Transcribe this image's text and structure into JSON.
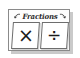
{
  "tile": {
    "title": "Fractions",
    "title_accent_color": "#2b2b2b",
    "panel_background": "#fdfdfd",
    "panel_border_color": "#8a8a8a",
    "shadow_color": "#b8b8b8",
    "left_doodle": "curved-arrow-left",
    "right_doodle": "curved-arrow-right",
    "cards": [
      {
        "name": "multiply",
        "symbol": "×",
        "symbol_name": "multiply-sign",
        "border_color": "#6d6d6d",
        "background": "#ffffff"
      },
      {
        "name": "divide",
        "symbol": "÷",
        "symbol_name": "divide-sign",
        "border_color": "#6d6d6d",
        "background": "#ffffff"
      }
    ]
  }
}
